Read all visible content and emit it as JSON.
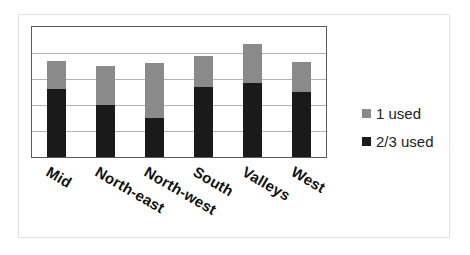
{
  "chart_data": {
    "type": "bar",
    "stacked": true,
    "title": "",
    "xlabel": "",
    "ylabel": "",
    "categories": [
      "Mid",
      "North-east",
      "North-west",
      "South",
      "Valleys",
      "West"
    ],
    "series": [
      {
        "name": "2/3 used",
        "color": "#1a1a1a",
        "values": [
          26,
          20,
          15,
          27,
          28.5,
          25
        ]
      },
      {
        "name": "1 used",
        "color": "#8a8a8a",
        "values": [
          11,
          15,
          21,
          12,
          15,
          11.5
        ]
      }
    ],
    "ylim": [
      0,
      50
    ],
    "grid_step": 10,
    "grid": true,
    "y_tick_labels_visible": false,
    "legend": {
      "position": "right",
      "order": [
        "1 used",
        "2/3 used"
      ]
    },
    "x_label_rotation_deg": 30
  },
  "legend": {
    "items": [
      {
        "label": "1 used",
        "color": "#8a8a8a"
      },
      {
        "label": "2/3 used",
        "color": "#1a1a1a"
      }
    ]
  }
}
